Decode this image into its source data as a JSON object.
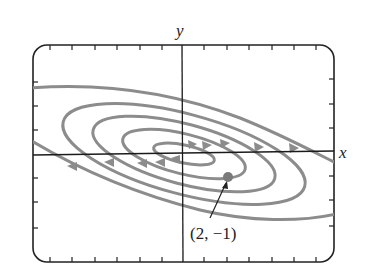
{
  "diagram": {
    "type": "phase-portrait",
    "axes": {
      "x_label": "x",
      "y_label": "y"
    },
    "point": {
      "label": "(2, −1)",
      "x": 2,
      "y": -1
    },
    "colors": {
      "trajectory": "#8a8a8a",
      "axis": "#1a1a1a",
      "point": "#7a7a7a",
      "frame": "#222222"
    },
    "trajectory_count": 5,
    "direction": "clockwise-outward spiral"
  }
}
